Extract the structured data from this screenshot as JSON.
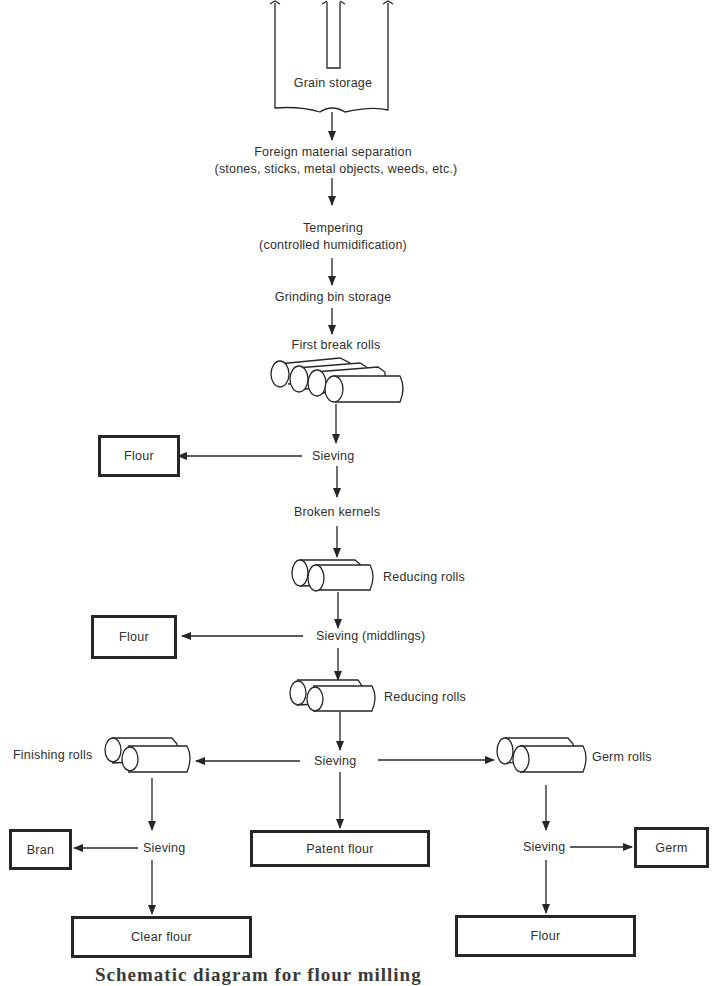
{
  "diagram": {
    "title_caption": "Schematic diagram for flour milling",
    "main_flow": {
      "grain_storage": "Grain storage",
      "foreign_material_line1": "Foreign material separation",
      "foreign_material_line2": "(stones, sticks, metal objects, weeds, etc.)",
      "tempering_line1": "Tempering",
      "tempering_line2": "(controlled humidification)",
      "grinding_bin": "Grinding bin storage",
      "first_break_rolls": "First break rolls",
      "sieving_1": "Sieving",
      "broken_kernels": "Broken kernels",
      "reducing_rolls_1": "Reducing rolls",
      "sieving_middlings": "Sieving (middlings)",
      "reducing_rolls_2": "Reducing rolls",
      "sieving_3": "Sieving"
    },
    "left_branch": {
      "finishing_rolls": "Finishing rolls",
      "sieving": "Sieving"
    },
    "right_branch": {
      "germ_rolls": "Germ rolls",
      "sieving": "Sieving"
    },
    "products": {
      "flour_1": "Flour",
      "flour_2": "Flour",
      "bran": "Bran",
      "patent_flour": "Patent flour",
      "germ": "Germ",
      "clear_flour": "Clear flour",
      "flour_3": "Flour"
    },
    "icons": {
      "grain_bin": "silo-icon",
      "rolls": "roller-mill-icon",
      "arrow": "arrow-icon"
    },
    "colors": {
      "line": "#262626",
      "text": "#2f2f2f",
      "background": "#ffffff"
    }
  }
}
